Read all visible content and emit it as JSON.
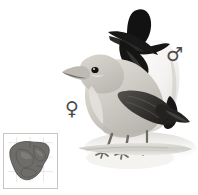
{
  "plate": {
    "name": "bird-identification-plate",
    "background_color": "#ffffff",
    "width": 198,
    "height": 195
  },
  "symbols": {
    "female": {
      "glyph": "♀",
      "label": "female",
      "color": "#4a4a4a",
      "x": 65,
      "y": 99
    },
    "male": {
      "glyph": "♂",
      "label": "male",
      "color": "#4a4a4a",
      "x": 166,
      "y": 45
    }
  },
  "birds": [
    {
      "id": "male-bird",
      "sex": "male",
      "position": "rear-upper-right",
      "head_color": "#111111",
      "body_color": "#f2f2f0",
      "wing_color": "#141414",
      "bill_color": "#1a1a1a",
      "description": "Black head and black wing with pale whitish body, perched upright behind the female"
    },
    {
      "id": "female-bird",
      "sex": "female",
      "position": "front-left",
      "head_color": "#c9c6c0",
      "body_color": "#d8d5cf",
      "wing_color": "#3a3a38",
      "bill_color": "#b8b5ae",
      "eye_color": "#111111",
      "description": "Grey-buff head and underparts with dark grey wing and tail, perched in front facing left"
    }
  ],
  "perch": {
    "name": "branch-perch",
    "color": "#d6d4ce",
    "shadow_color": "#e7e5e0",
    "description": "Pale horizontal branch with soft grey shadow beneath"
  },
  "map": {
    "name": "distribution-map",
    "region": "southern-africa",
    "border_color": "#c8c6c0",
    "background_color": "#ffffff",
    "range_fill_color": "#6f6d6a",
    "outline_color": "#4a4846",
    "x": 3,
    "y": 133,
    "width": 55,
    "height": 56
  }
}
